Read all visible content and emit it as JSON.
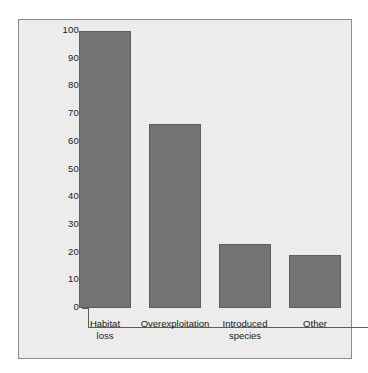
{
  "chart_data": {
    "type": "bar",
    "title": "",
    "xlabel": "",
    "ylabel": "Percent of species affected",
    "categories": [
      "Habitat\nloss",
      "Overexploitation",
      "Introduced\nspecies",
      "Other"
    ],
    "values": [
      100,
      66.5,
      23,
      19
    ],
    "ylim": [
      0,
      100
    ],
    "ytick_labels": [
      "100",
      "90",
      "80",
      "70",
      "60",
      "50",
      "40",
      "30",
      "20",
      "10",
      "0"
    ],
    "ytick_values": [
      100,
      90,
      80,
      70,
      60,
      50,
      40,
      30,
      20,
      10,
      0
    ],
    "grid": false,
    "legend": null,
    "colors": {
      "bar_fill": "#737373",
      "bar_edge": "#5f5f5f",
      "panel_background": "#ececeb",
      "figure_background": "#ffffff",
      "axis_line": "#5a5a5a",
      "text": "#1a1a1a",
      "panel_border": "#8c8c8c"
    }
  }
}
